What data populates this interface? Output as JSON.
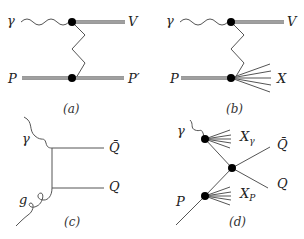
{
  "figure": {
    "panels": [
      {
        "id": "a",
        "caption": "(a)",
        "labels": {
          "photon": "γ",
          "vector_meson": "V",
          "proton_in": "P",
          "proton_out": "P′"
        },
        "description": "elastic vector meson production: photon to V, zigzag exchange to proton P → P′"
      },
      {
        "id": "b",
        "caption": "(b)",
        "labels": {
          "photon": "γ",
          "vector_meson": "V",
          "proton_in": "P",
          "dissociated": "X"
        },
        "description": "proton-dissociative vector meson production: photon to V, zigzag exchange, proton dissociates to X"
      },
      {
        "id": "c",
        "caption": "(c)",
        "labels": {
          "photon": "γ",
          "gluon": "g",
          "antiquark": "Q̄",
          "quark": "Q"
        },
        "description": "direct photon-gluon fusion into heavy quark pair"
      },
      {
        "id": "d",
        "caption": "(d)",
        "labels": {
          "photon": "γ",
          "photon_remnant": "X",
          "photon_remnant_sub": "γ",
          "antiquark": "Q̄",
          "quark": "Q",
          "proton": "P",
          "proton_remnant": "X",
          "proton_remnant_sub": "P"
        },
        "description": "resolved photon process producing heavy quark pair with remnants X_γ and X_P"
      }
    ],
    "colors": {
      "line": "#555555",
      "vertex": "#000000",
      "background": "#ffffff"
    }
  }
}
